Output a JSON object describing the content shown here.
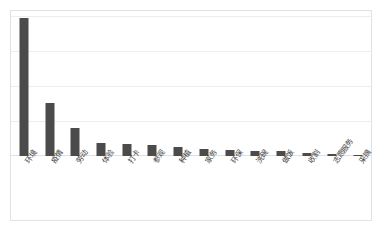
{
  "chart_data": {
    "type": "bar",
    "title": "",
    "subtitle": "",
    "xlabel": "",
    "ylabel": "",
    "categories": [
      "环境",
      "疫情",
      "劳动",
      "体验",
      "打卡",
      "参观",
      "种植",
      "家务",
      "环保",
      "洗碗",
      "做饭",
      "收割",
      "志愿服务",
      "采摘"
    ],
    "values": [
      138,
      53,
      28,
      13,
      12,
      11,
      9,
      7,
      6,
      5,
      5,
      3,
      2,
      1
    ],
    "ylim": [
      0,
      145
    ],
    "yticks": [
      0,
      29,
      58,
      87,
      116,
      145
    ],
    "gridlines": 5,
    "grid": true,
    "legend": false,
    "legend_position": "none",
    "series": [
      {
        "name": "频次",
        "values": [
          138,
          53,
          28,
          13,
          12,
          11,
          9,
          7,
          6,
          5,
          5,
          3,
          2,
          1
        ]
      }
    ]
  },
  "style": {
    "bar_color": "#4b4b4b",
    "grid_color": "#ededed",
    "frame_color": "#e2e2e2",
    "background": "#ffffff",
    "label_color": "#3d3d3d"
  }
}
